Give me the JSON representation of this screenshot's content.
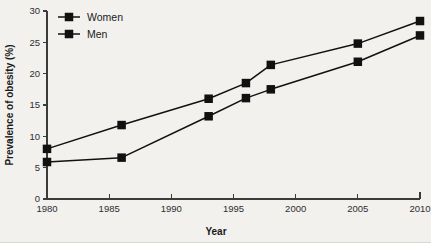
{
  "chart_data": {
    "type": "line",
    "title": "",
    "xlabel": "Year",
    "ylabel": "Prevalence of obesity (%)",
    "xlim": [
      1980,
      2010
    ],
    "ylim": [
      0,
      30
    ],
    "grid": false,
    "legend_position": "top-left",
    "x": [
      1980,
      1986,
      1993,
      1996,
      1998,
      2005,
      2010
    ],
    "xticks": [
      "1980",
      "1985",
      "1990",
      "1995",
      "2000",
      "2005",
      "2010"
    ],
    "xtick_values": [
      1980,
      1985,
      1990,
      1995,
      2000,
      2005,
      2010
    ],
    "yticks": [
      "0",
      "5",
      "10",
      "15",
      "20",
      "25",
      "30"
    ],
    "ytick_values": [
      0,
      5,
      10,
      15,
      20,
      25,
      30
    ],
    "marker": "square",
    "series": [
      {
        "name": "Women",
        "color": "#111111",
        "values": [
          8.0,
          11.8,
          16.0,
          18.5,
          21.4,
          24.8,
          28.4
        ]
      },
      {
        "name": "Men",
        "color": "#111111",
        "values": [
          5.9,
          6.6,
          13.2,
          16.1,
          17.5,
          21.9,
          26.1
        ]
      }
    ]
  },
  "legend": {
    "items": [
      {
        "label": "Women"
      },
      {
        "label": "Men"
      }
    ]
  },
  "axes": {
    "x_title": "Year",
    "y_title": "Prevalence of obesity (%)"
  },
  "colors": {
    "background": "#f2f1ee",
    "ink": "#111111",
    "axis": "#3b3b3b"
  }
}
